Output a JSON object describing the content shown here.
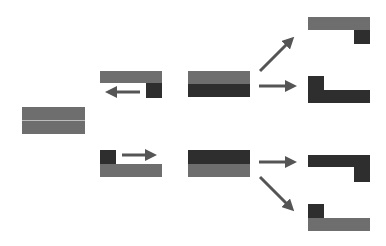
{
  "colors": {
    "light": "#6e6e6e",
    "dark": "#2e2e2e",
    "arrow": "#555555",
    "divider": "#bdbdbd",
    "background": "#ffffff"
  },
  "diagram": {
    "source_block": {
      "x": 22,
      "y": 107,
      "w": 63,
      "h": 27,
      "split": "horizontal-line",
      "line_y": 120
    },
    "stage2": [
      {
        "id": "upper",
        "bar": {
          "x": 100,
          "y": 71,
          "w": 62,
          "h": 12,
          "color": "light"
        },
        "square": {
          "x": 146,
          "y": 83,
          "w": 16,
          "h": 15,
          "color": "dark"
        },
        "arrow": {
          "from": [
            140,
            92
          ],
          "to": [
            107,
            92
          ]
        }
      },
      {
        "id": "lower",
        "square": {
          "x": 100,
          "y": 150,
          "w": 16,
          "h": 14,
          "color": "dark"
        },
        "bar": {
          "x": 100,
          "y": 164,
          "w": 62,
          "h": 13,
          "color": "light"
        },
        "arrow": {
          "from": [
            122,
            155
          ],
          "to": [
            155,
            155
          ]
        }
      }
    ],
    "stage3": [
      {
        "id": "upper",
        "x": 188,
        "y": 71,
        "w": 62,
        "h": 26,
        "top": "light",
        "bottom": "dark"
      },
      {
        "id": "lower",
        "x": 188,
        "y": 150,
        "w": 62,
        "h": 27,
        "top": "dark",
        "bottom": "light"
      }
    ],
    "stage4": [
      {
        "id": "r1",
        "bar": {
          "x": 308,
          "y": 17,
          "w": 62,
          "h": 13,
          "color": "light"
        },
        "square": {
          "x": 354,
          "y": 30,
          "w": 16,
          "h": 14,
          "color": "dark"
        }
      },
      {
        "id": "r2",
        "square": {
          "x": 308,
          "y": 76,
          "w": 16,
          "h": 14,
          "color": "dark"
        },
        "bar": {
          "x": 308,
          "y": 90,
          "w": 62,
          "h": 13,
          "color": "dark"
        }
      },
      {
        "id": "r3",
        "bar": {
          "x": 308,
          "y": 155,
          "w": 62,
          "h": 12,
          "color": "dark"
        },
        "square": {
          "x": 354,
          "y": 167,
          "w": 16,
          "h": 15,
          "color": "dark"
        }
      },
      {
        "id": "r4",
        "square": {
          "x": 308,
          "y": 204,
          "w": 16,
          "h": 14,
          "color": "dark"
        },
        "bar": {
          "x": 308,
          "y": 218,
          "w": 62,
          "h": 13,
          "color": "light"
        }
      }
    ],
    "arrows_stage3_to_4": [
      {
        "from": [
          260,
          71
        ],
        "to": [
          293,
          38
        ]
      },
      {
        "from": [
          259,
          86
        ],
        "to": [
          295,
          86
        ]
      },
      {
        "from": [
          259,
          162
        ],
        "to": [
          295,
          162
        ]
      },
      {
        "from": [
          260,
          177
        ],
        "to": [
          293,
          210
        ]
      }
    ]
  }
}
